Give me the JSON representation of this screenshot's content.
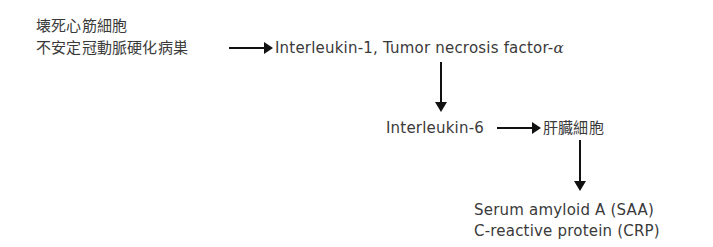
{
  "diagram": {
    "sources": {
      "line1": "壊死心筋細胞",
      "line2": "不安定冠動脈硬化病巣"
    },
    "cytokines_1": {
      "text": "Interleukin-1, Tumor necrosis factor-",
      "greek": "α"
    },
    "cytokine_2": "Interleukin-6",
    "target_cell": "肝臓細胞",
    "products": {
      "line1": "Serum amyloid A (SAA)",
      "line2": "C-reactive protein (CRP)"
    },
    "edges": [
      {
        "from": "sources",
        "to": "cytokines_1",
        "icon": "arrow-right-icon"
      },
      {
        "from": "cytokines_1",
        "to": "cytokine_2",
        "icon": "arrow-down-icon"
      },
      {
        "from": "cytokine_2",
        "to": "target_cell",
        "icon": "arrow-right-icon"
      },
      {
        "from": "target_cell",
        "to": "products",
        "icon": "arrow-down-icon"
      }
    ]
  }
}
